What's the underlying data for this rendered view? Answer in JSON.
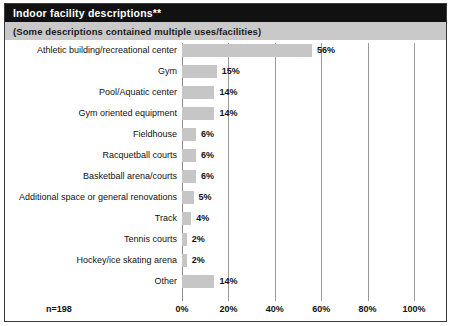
{
  "header": {
    "title": "Indoor facility descriptions**",
    "subtitle": "(Some descriptions contained multiple uses/facilities)"
  },
  "footer": {
    "sample_size": "n=198"
  },
  "colors": {
    "title_bar_bg": "#111111",
    "title_text": "#ffffff",
    "subtitle_bar_bg": "#c9c9c9",
    "bar_fill": "#c6c6c6",
    "gridline": "#9a9a9a",
    "frame_border": "#3a3a3a",
    "text": "#111111"
  },
  "chart_data": {
    "type": "bar",
    "orientation": "horizontal",
    "title": "Indoor facility descriptions**",
    "subtitle": "(Some descriptions contained multiple uses/facilities)",
    "xlabel": "",
    "ylabel": "",
    "xlim": [
      0,
      100
    ],
    "grid": true,
    "legend": false,
    "annotation": "n=198",
    "tick_labels": [
      "0%",
      "20%",
      "40%",
      "60%",
      "80%",
      "100%"
    ],
    "ticks": [
      0,
      20,
      40,
      60,
      80,
      100
    ],
    "categories": [
      "Athletic building/recreational center",
      "Gym",
      "Pool/Aquatic center",
      "Gym oriented equipment",
      "Fieldhouse",
      "Racquetball courts",
      "Basketball arena/courts",
      "Additional space or general renovations",
      "Track",
      "Tennis courts",
      "Hockey/ice skating arena",
      "Other"
    ],
    "values": [
      56,
      15,
      14,
      14,
      6,
      6,
      6,
      5,
      4,
      2,
      2,
      14
    ],
    "value_labels": [
      "56%",
      "15%",
      "14%",
      "14%",
      "6%",
      "6%",
      "6%",
      "5%",
      "4%",
      "2%",
      "2%",
      "14%"
    ]
  }
}
